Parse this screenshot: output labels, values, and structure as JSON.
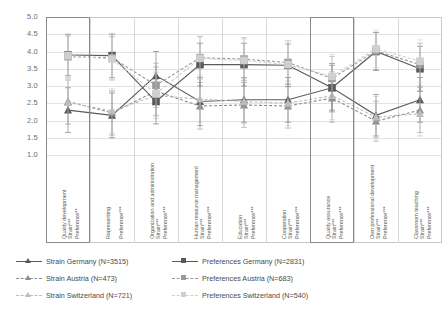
{
  "chart_data": {
    "type": "line",
    "title": "",
    "xlabel": "",
    "ylabel": "",
    "ylim": [
      1.0,
      5.0
    ],
    "ytick_labels": [
      "5.0",
      "4.5",
      "4.0",
      "3.5",
      "3.0",
      "2.5",
      "2.0",
      "1.5",
      "1.0"
    ],
    "ytick_values": [
      5.0,
      4.5,
      4.0,
      3.5,
      3.0,
      2.5,
      2.0,
      1.5,
      1.0
    ],
    "grid": true,
    "legend_position": "bottom",
    "error_bars": true,
    "categories": [
      {
        "name": "Quality development",
        "strain_sig": "Strain***",
        "pref_sig": "Preference**"
      },
      {
        "name": "Representing",
        "strain_sig": "",
        "pref_sig": "Preference***"
      },
      {
        "name": "Organization and administration",
        "strain_sig": "Strain***",
        "pref_sig": "Preference***"
      },
      {
        "name": "Human resource management",
        "strain_sig": "Strain***",
        "pref_sig": "Preference***"
      },
      {
        "name": "Education",
        "strain_sig": "Strain***",
        "pref_sig": "Preference***"
      },
      {
        "name": "Cooperation",
        "strain_sig": "Strain***",
        "pref_sig": "Preference***"
      },
      {
        "name": "Quality assurance",
        "strain_sig": "Strain***",
        "pref_sig": "Preference***"
      },
      {
        "name": "Own professional development",
        "strain_sig": "Strain***",
        "pref_sig": "Preference***"
      },
      {
        "name": "Classroom teaching",
        "strain_sig": "Strain***",
        "pref_sig": "Preference***"
      }
    ],
    "category_labels": [
      "Quality development",
      "Representing",
      "Organization and administration",
      "Human resource management",
      "Education",
      "Cooperation",
      "Quality assurance",
      "Own professional development",
      "Classroom teaching"
    ],
    "series": [
      {
        "name": "Strain Germany (N=3515)",
        "key": "strain_germany",
        "marker": "triangle",
        "color": "#595959",
        "linestyle": "solid",
        "values": [
          2.3,
          2.15,
          3.3,
          2.55,
          2.6,
          2.6,
          2.95,
          2.15,
          2.6
        ],
        "err_low": [
          1.65,
          1.5,
          2.6,
          1.85,
          1.95,
          1.95,
          2.25,
          1.55,
          1.95
        ],
        "err_high": [
          2.95,
          2.8,
          4.0,
          3.25,
          3.25,
          3.25,
          3.65,
          2.75,
          3.25
        ]
      },
      {
        "name": "Strain Austria (N=473)",
        "key": "strain_austria",
        "marker": "triangle",
        "color": "#8d8d8d",
        "linestyle": "dashed",
        "values": [
          2.55,
          2.22,
          2.85,
          2.42,
          2.45,
          2.42,
          2.65,
          1.98,
          2.3
        ],
        "err_low": [
          1.9,
          1.58,
          2.15,
          1.75,
          1.8,
          1.78,
          1.95,
          1.4,
          1.65
        ],
        "err_high": [
          3.2,
          2.86,
          3.55,
          3.1,
          3.1,
          3.06,
          3.35,
          2.56,
          2.95
        ]
      },
      {
        "name": "Strain Switzerland (N=721)",
        "key": "strain_switzerland",
        "marker": "triangle",
        "color": "#bdbdbd",
        "linestyle": "dashed",
        "values": [
          2.52,
          2.28,
          2.72,
          2.62,
          2.55,
          2.5,
          2.72,
          2.1,
          2.2
        ],
        "err_low": [
          1.88,
          1.64,
          2.05,
          1.95,
          1.9,
          1.85,
          2.02,
          1.5,
          1.55
        ],
        "err_high": [
          3.16,
          2.92,
          3.39,
          3.29,
          3.2,
          3.15,
          3.42,
          2.7,
          2.85
        ]
      },
      {
        "name": "Preferences Germany (N=2831)",
        "key": "pref_germany",
        "marker": "square",
        "color": "#5a5a5a",
        "linestyle": "solid",
        "values": [
          3.9,
          3.88,
          2.55,
          3.62,
          3.62,
          3.6,
          2.95,
          4.0,
          3.5
        ],
        "err_low": [
          3.3,
          3.25,
          1.9,
          3.0,
          3.0,
          2.98,
          2.3,
          3.45,
          2.85
        ],
        "err_high": [
          4.5,
          4.51,
          3.2,
          4.24,
          4.24,
          4.22,
          3.6,
          4.55,
          4.15
        ]
      },
      {
        "name": "Preferences Austria (N=683)",
        "key": "pref_austria",
        "marker": "square",
        "color": "#9a9a9a",
        "linestyle": "dashed",
        "values": [
          3.85,
          3.82,
          3.02,
          3.82,
          3.78,
          3.68,
          3.22,
          4.02,
          3.62
        ],
        "err_low": [
          3.25,
          3.2,
          2.38,
          3.2,
          3.16,
          3.05,
          2.58,
          3.48,
          3.0
        ],
        "err_high": [
          4.45,
          4.44,
          3.66,
          4.44,
          4.4,
          4.31,
          3.86,
          4.56,
          4.24
        ]
      },
      {
        "name": "Preferences Switzerland (N=540)",
        "key": "pref_switzerland",
        "marker": "square",
        "color": "#cfcfcf",
        "linestyle": "dashed",
        "values": [
          3.88,
          3.78,
          2.78,
          3.8,
          3.74,
          3.62,
          3.28,
          4.08,
          3.72
        ],
        "err_low": [
          3.28,
          3.16,
          2.12,
          3.18,
          3.12,
          3.0,
          2.64,
          3.54,
          3.1
        ],
        "err_high": [
          4.48,
          4.4,
          3.44,
          4.42,
          4.36,
          4.24,
          3.92,
          4.62,
          4.34
        ]
      }
    ],
    "highlights": [
      {
        "category_index": 0,
        "label": "Quality development"
      },
      {
        "category_index": 6,
        "label": "Quality assurance"
      }
    ]
  },
  "legend": {
    "entries": [
      {
        "label": "Strain Germany (N=3515)",
        "key": "strain_germany"
      },
      {
        "label": "Strain Austria (N=473)",
        "key": "strain_austria"
      },
      {
        "label": "Strain Switzerland (N=721)",
        "key": "strain_switzerland"
      },
      {
        "label": "Preferences Germany (N=2831)",
        "key": "pref_germany"
      },
      {
        "label": "Preferences Austria (N=683)",
        "key": "pref_austria"
      },
      {
        "label": "Preferences Switzerland (N=540)",
        "key": "pref_switzerland"
      }
    ]
  }
}
